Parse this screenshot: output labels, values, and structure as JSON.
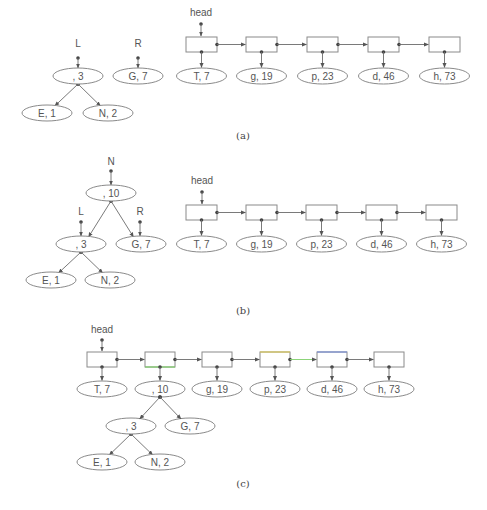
{
  "colors": {
    "edge": "#6b6b6b",
    "node_stroke": "#8a8a8a",
    "text": "#555555",
    "highlight_green": "#7fcf6a",
    "highlight_yellow": "#d9c85a",
    "highlight_blue": "#7a8fd6"
  },
  "panels": [
    {
      "id": "a",
      "caption": "(a)",
      "caption_pos": [
        243,
        139
      ],
      "pointers": [
        {
          "label": "L",
          "x": 78,
          "label_y": 47,
          "dot_y": 58,
          "target_y": 68
        },
        {
          "label": "R",
          "x": 138,
          "label_y": 47,
          "dot_y": 58,
          "target_y": 68
        }
      ],
      "tree_nodes": [
        {
          "id": "n3",
          "text": ", 3",
          "cx": 78,
          "cy": 76
        },
        {
          "id": "e1",
          "text": "E, 1",
          "cx": 47,
          "cy": 113
        },
        {
          "id": "n2",
          "text": "N, 2",
          "cx": 108,
          "cy": 113
        },
        {
          "id": "g7",
          "text": "G, 7",
          "cx": 138,
          "cy": 76
        }
      ],
      "tree_edges": [
        {
          "from": "n3",
          "to": "e1"
        },
        {
          "from": "n3",
          "to": "n2"
        }
      ],
      "list": {
        "head_label": "head",
        "head_x": 201,
        "head_label_y": 16,
        "head_dot_y": 24,
        "box_y": 37,
        "box_w": 31,
        "box_h": 15,
        "ell_y": 76,
        "boxes": [
          {
            "x": 186,
            "value": "T, 7"
          },
          {
            "x": 246,
            "value": "g, 19"
          },
          {
            "x": 307,
            "value": "p, 23"
          },
          {
            "x": 368,
            "value": "d, 46"
          },
          {
            "x": 429,
            "value": "h, 73"
          }
        ]
      }
    },
    {
      "id": "b",
      "caption": "(b)",
      "caption_pos": [
        243,
        314
      ],
      "pointers": [
        {
          "label": "N",
          "x": 111,
          "label_y": 165,
          "dot_y": 171,
          "target_y": 185
        },
        {
          "label": "L",
          "x": 81,
          "label_y": 215,
          "dot_y": 222,
          "target_y": 236
        },
        {
          "label": "R",
          "x": 140,
          "label_y": 215,
          "dot_y": 222,
          "target_y": 236
        }
      ],
      "tree_nodes": [
        {
          "id": "n10",
          "text": ", 10",
          "cx": 111,
          "cy": 193
        },
        {
          "id": "n3",
          "text": ", 3",
          "cx": 81,
          "cy": 244
        },
        {
          "id": "g7",
          "text": "G, 7",
          "cx": 141,
          "cy": 244
        },
        {
          "id": "e1",
          "text": "E, 1",
          "cx": 51,
          "cy": 280
        },
        {
          "id": "n2",
          "text": "N, 2",
          "cx": 110,
          "cy": 280
        }
      ],
      "tree_edges": [
        {
          "from": "n10",
          "to": "n3"
        },
        {
          "from": "n10",
          "to": "g7"
        },
        {
          "from": "n3",
          "to": "e1"
        },
        {
          "from": "n3",
          "to": "n2"
        }
      ],
      "list": {
        "head_label": "head",
        "head_x": 202,
        "head_label_y": 184,
        "head_dot_y": 192,
        "box_y": 205,
        "box_w": 31,
        "box_h": 15,
        "ell_y": 244,
        "boxes": [
          {
            "x": 186,
            "value": "T, 7"
          },
          {
            "x": 246,
            "value": "g, 19"
          },
          {
            "x": 306,
            "value": "p, 23"
          },
          {
            "x": 366,
            "value": "d, 46"
          },
          {
            "x": 426,
            "value": "h, 73"
          }
        ]
      }
    },
    {
      "id": "c",
      "caption": "(c)",
      "caption_pos": [
        243,
        487
      ],
      "pointers": [],
      "tree_nodes": [
        {
          "id": "n3",
          "text": ", 3",
          "cx": 131,
          "cy": 426
        },
        {
          "id": "g7",
          "text": "G, 7",
          "cx": 190,
          "cy": 426
        },
        {
          "id": "e1",
          "text": "E, 1",
          "cx": 102,
          "cy": 462
        },
        {
          "id": "n2",
          "text": "N, 2",
          "cx": 160,
          "cy": 462
        }
      ],
      "tree_edges": [
        {
          "from": "n3",
          "to": "e1"
        },
        {
          "from": "n3",
          "to": "n2"
        }
      ],
      "list_tree_edges": [
        {
          "from_box": 1,
          "to": "n3"
        },
        {
          "from_box": 1,
          "to": "g7"
        }
      ],
      "list": {
        "head_label": "head",
        "head_x": 102,
        "head_label_y": 333,
        "head_dot_y": 340,
        "box_y": 352,
        "box_w": 30,
        "box_h": 15,
        "ell_y": 389,
        "boxes": [
          {
            "x": 87,
            "value": "T, 7"
          },
          {
            "x": 145,
            "value": ", 10",
            "accent_bottom": "#7fcf6a"
          },
          {
            "x": 202,
            "value": "g, 19"
          },
          {
            "x": 260,
            "value": "p, 23",
            "accent_top": "#d9c85a"
          },
          {
            "x": 317,
            "value": "d, 46",
            "accent_top": "#7a8fd6"
          },
          {
            "x": 374,
            "value": "h, 73"
          }
        ],
        "link_colors": {
          "3": "#7fcf6a"
        }
      }
    }
  ]
}
